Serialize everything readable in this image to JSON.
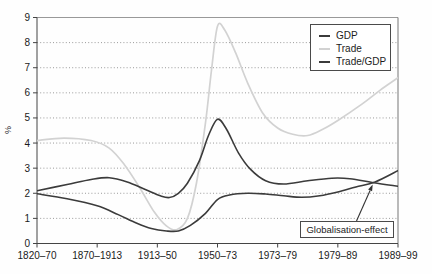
{
  "chart_data": {
    "type": "line",
    "title": "",
    "xlabel": "",
    "ylabel": "%",
    "ylim": [
      0,
      9
    ],
    "yticks": [
      0,
      1,
      2,
      3,
      4,
      5,
      6,
      7,
      8,
      9
    ],
    "categories": [
      "1820–70",
      "1870–1913",
      "1913–50",
      "1950–73",
      "1973–79",
      "1979–89",
      "1989–99"
    ],
    "grid": "horizontal dotted lines at each integer",
    "legend_position": "top-right",
    "legend": [
      {
        "label": "GDP",
        "color": "#3b3b3b"
      },
      {
        "label": "Trade",
        "color": "#d2d2d2"
      },
      {
        "label": "Trade/GDP",
        "color": "#3b3b3b"
      }
    ],
    "annotation": {
      "text": "Globalisation-effect",
      "arrow_tip": {
        "x_category_units": 5.58,
        "y_value": 2.35
      }
    },
    "series": [
      {
        "name": "Trade",
        "color": "#d2d2d2",
        "width": 1.7,
        "points": [
          [
            0,
            4.1
          ],
          [
            0.45,
            4.2
          ],
          [
            0.9,
            4.1
          ],
          [
            1.2,
            3.8
          ],
          [
            1.45,
            3.15
          ],
          [
            1.7,
            2.25
          ],
          [
            1.95,
            1.25
          ],
          [
            2.15,
            0.7
          ],
          [
            2.32,
            0.55
          ],
          [
            2.5,
            1.0
          ],
          [
            2.65,
            2.4
          ],
          [
            2.8,
            4.8
          ],
          [
            2.9,
            6.9
          ],
          [
            3.0,
            8.65
          ],
          [
            3.12,
            8.5
          ],
          [
            3.3,
            7.6
          ],
          [
            3.5,
            6.4
          ],
          [
            3.75,
            5.2
          ],
          [
            4.0,
            4.6
          ],
          [
            4.25,
            4.35
          ],
          [
            4.5,
            4.3
          ],
          [
            4.75,
            4.55
          ],
          [
            5.0,
            4.9
          ],
          [
            5.4,
            5.55
          ],
          [
            5.7,
            6.1
          ],
          [
            6.0,
            6.6
          ]
        ]
      },
      {
        "name": "GDP",
        "color": "#3b3b3b",
        "width": 1.6,
        "points": [
          [
            0,
            2.1
          ],
          [
            0.5,
            2.35
          ],
          [
            0.9,
            2.55
          ],
          [
            1.2,
            2.62
          ],
          [
            1.5,
            2.45
          ],
          [
            1.8,
            2.15
          ],
          [
            2.05,
            1.9
          ],
          [
            2.2,
            1.83
          ],
          [
            2.35,
            2.0
          ],
          [
            2.5,
            2.4
          ],
          [
            2.7,
            3.3
          ],
          [
            2.85,
            4.3
          ],
          [
            3.0,
            4.95
          ],
          [
            3.15,
            4.55
          ],
          [
            3.35,
            3.6
          ],
          [
            3.55,
            2.95
          ],
          [
            3.8,
            2.5
          ],
          [
            4.1,
            2.37
          ],
          [
            4.5,
            2.5
          ],
          [
            4.9,
            2.6
          ],
          [
            5.2,
            2.58
          ],
          [
            5.6,
            2.42
          ],
          [
            6.0,
            2.28
          ]
        ]
      },
      {
        "name": "Trade/GDP",
        "color": "#3b3b3b",
        "width": 1.6,
        "points": [
          [
            0,
            1.98
          ],
          [
            0.5,
            1.78
          ],
          [
            1.0,
            1.5
          ],
          [
            1.35,
            1.15
          ],
          [
            1.65,
            0.82
          ],
          [
            1.9,
            0.6
          ],
          [
            2.15,
            0.5
          ],
          [
            2.35,
            0.5
          ],
          [
            2.55,
            0.72
          ],
          [
            2.8,
            1.2
          ],
          [
            3.0,
            1.75
          ],
          [
            3.2,
            1.93
          ],
          [
            3.5,
            2.0
          ],
          [
            3.8,
            1.97
          ],
          [
            4.1,
            1.9
          ],
          [
            4.4,
            1.84
          ],
          [
            4.7,
            1.9
          ],
          [
            5.0,
            2.05
          ],
          [
            5.3,
            2.25
          ],
          [
            5.62,
            2.45
          ],
          [
            6.0,
            2.9
          ]
        ]
      }
    ],
    "style": {
      "axis_color": "#444444",
      "frame_top_color": "#999999",
      "frame_right_color": "#777777",
      "grid_color": "#9a9a9a",
      "tick_label_color": "#1a1a1a",
      "arrow_color": "#333333"
    }
  }
}
